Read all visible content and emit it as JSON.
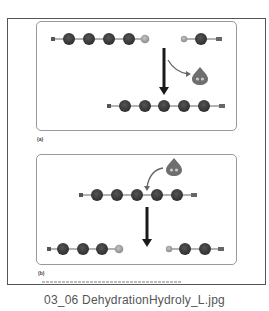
{
  "figure": {
    "panels": [
      {
        "id": "a",
        "label": "(a)",
        "process": "dehydration",
        "reactants": [
          {
            "left_cap": "H",
            "monomers": 4,
            "right_cap": "OH"
          },
          {
            "left_cap": "H",
            "monomers": 1,
            "right_cap": "OH"
          }
        ],
        "byproduct": "H2O",
        "product": {
          "left_cap": "H",
          "monomers": 5,
          "right_cap": "OH"
        }
      },
      {
        "id": "b",
        "label": "(b)",
        "process": "hydrolysis",
        "reactant": {
          "left_cap": "H",
          "monomers": 5,
          "right_cap": "OH"
        },
        "added": "H2O",
        "products": [
          {
            "left_cap": "H",
            "monomers": 3,
            "right_cap": "OH"
          },
          {
            "left_cap": "H",
            "monomers": 2,
            "right_cap": "OH"
          }
        ]
      }
    ],
    "cap_labels": {
      "h": "H",
      "oh": "OH",
      "water": "H₂O"
    },
    "copyright": "Copyright © Pearson Education, Inc., publishing as Pearson Benjamin Cummings. All rights reserved.",
    "colors": {
      "monomer": "#3a3a3a",
      "cap": "#9a9a9a",
      "water": "#7a7a7a",
      "arrow": "#1a1a1a",
      "frame": "#555555",
      "panel_border": "#999999"
    }
  },
  "caption": "03_06 DehydrationHydroly_L.jpg"
}
